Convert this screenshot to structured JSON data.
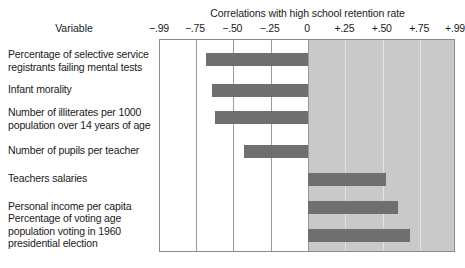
{
  "header": {
    "title": "Correlations with high school retention rate",
    "variable_column_label": "Variable"
  },
  "axis": {
    "tick_labels": [
      "−.99",
      "−.75",
      "−.50",
      "−.25",
      "0",
      "+.25",
      "+.50",
      "+.75",
      "+.99"
    ],
    "tick_values": [
      -0.99,
      -0.75,
      -0.5,
      -0.25,
      0,
      0.25,
      0.5,
      0.75,
      0.99
    ]
  },
  "colors": {
    "bar": "#6f6f6f",
    "positive_shade": "#c9c9c9",
    "gridline": "#9a9a9a",
    "frame": "#8a8a8a",
    "background": "#ffffff",
    "text": "#1a1a1a"
  },
  "rows": [
    {
      "label": "Percentage of selective service registrants failing mental tests",
      "lines": [
        "Percentage of selective service",
        "registrants failing mental tests"
      ],
      "value": -0.68
    },
    {
      "label": "Infant morality",
      "lines": [
        "Infant morality"
      ],
      "value": -0.64
    },
    {
      "label": "Number of illiterates per 1000 population over 14 years of age",
      "lines": [
        "Number of illiterates per 1000",
        "population over 14 years of age"
      ],
      "value": -0.62
    },
    {
      "label": "Number of pupils per teacher",
      "lines": [
        "Number of pupils per teacher"
      ],
      "value": -0.43
    },
    {
      "label": "Teachers salaries",
      "lines": [
        "Teachers salaries"
      ],
      "value": 0.52
    },
    {
      "label": "Personal income per capita",
      "lines": [
        "Personal income per capita"
      ],
      "value": 0.6
    },
    {
      "label": "Percentage of voting age population voting in 1960 presidential election",
      "lines": [
        "Percentage of voting age",
        "population voting in 1960",
        "presidential election"
      ],
      "value": 0.68
    }
  ],
  "chart_data": {
    "type": "bar",
    "orientation": "horizontal",
    "title": "Correlations with high school retention rate",
    "xlabel": "",
    "ylabel": "Variable",
    "xlim": [
      -0.99,
      0.99
    ],
    "xticks": [
      -0.99,
      -0.75,
      -0.5,
      -0.25,
      0,
      0.25,
      0.5,
      0.75,
      0.99
    ],
    "xticklabels": [
      "−.99",
      "−.75",
      "−.50",
      "−.25",
      "0",
      "+.25",
      "+.50",
      "+.75",
      "+.99"
    ],
    "grid": true,
    "legend": false,
    "categories": [
      "Percentage of selective service registrants failing mental tests",
      "Infant morality",
      "Number of illiterates per 1000 population over 14 years of age",
      "Number of pupils per teacher",
      "Teachers salaries",
      "Personal income per capita",
      "Percentage of voting age population voting in 1960 presidential election"
    ],
    "values": [
      -0.68,
      -0.64,
      -0.62,
      -0.43,
      0.52,
      0.6,
      0.68
    ],
    "annotations": [
      "Positive-correlation half of the plot is shaded gray"
    ]
  }
}
